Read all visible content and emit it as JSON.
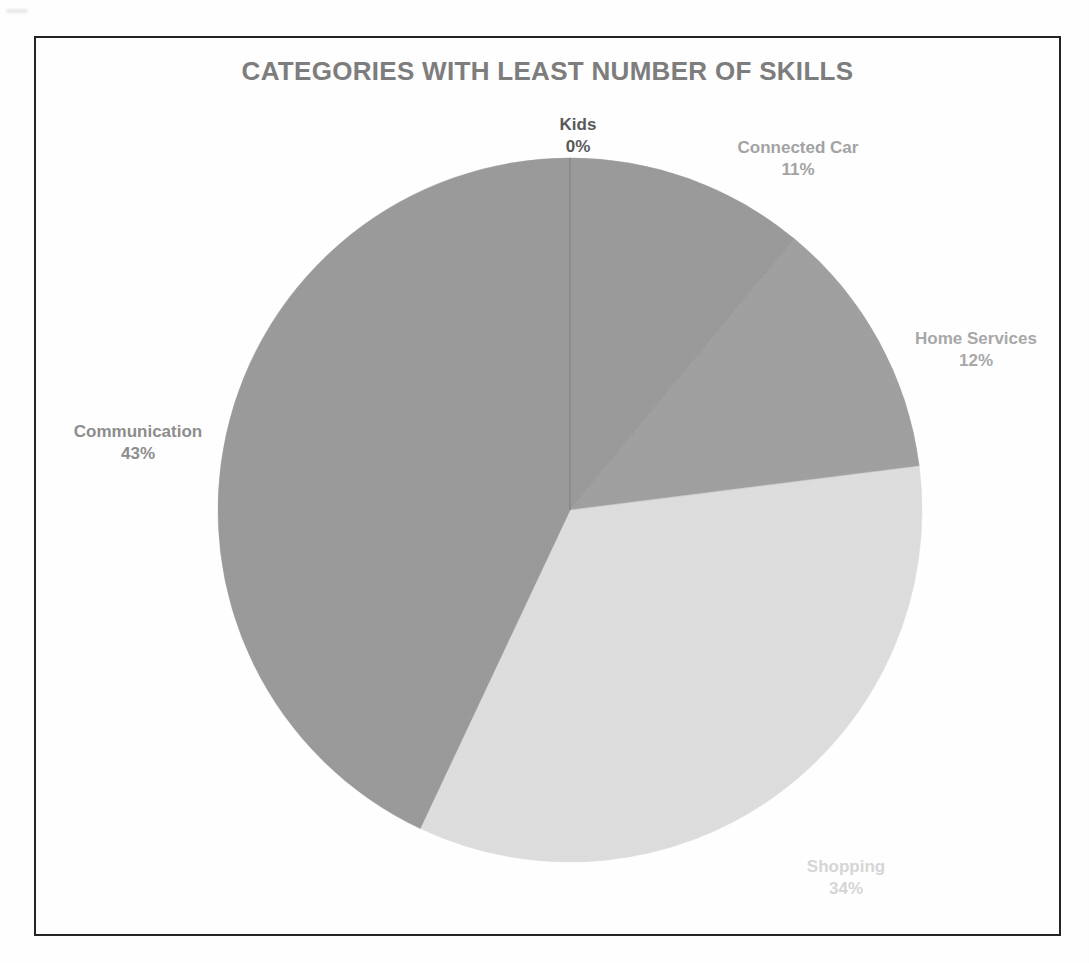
{
  "page": {
    "background_color": "#ffffff",
    "frame_border_color": "#232323"
  },
  "chart_data": {
    "type": "pie",
    "title": "CATEGORIES WITH LEAST NUMBER OF SKILLS",
    "xlabel": "",
    "ylabel": "",
    "legend_position": "none",
    "labels_position": "outside",
    "start_angle_deg": 0,
    "direction": "clockwise",
    "categories": [
      "Kids",
      "Connected Car",
      "Home Services",
      "Shopping",
      "Communication"
    ],
    "values": [
      0,
      11,
      12,
      34,
      43
    ],
    "value_labels": [
      "0%",
      "11%",
      "12%",
      "34%",
      "43%"
    ],
    "units": "percent",
    "total": 100,
    "slices": [
      {
        "name": "Kids",
        "value": 0,
        "value_label": "0%",
        "color": "#9d9d9d",
        "label_color": "#595959",
        "start_deg": 0,
        "end_deg": 0
      },
      {
        "name": "Connected Car",
        "value": 11,
        "value_label": "11%",
        "color": "#9a9a9a",
        "label_color": "#a3a3a3",
        "start_deg": 0,
        "end_deg": 39.6
      },
      {
        "name": "Home Services",
        "value": 12,
        "value_label": "12%",
        "color": "#a0a0a0",
        "label_color": "#a8a8a8",
        "start_deg": 39.6,
        "end_deg": 82.8
      },
      {
        "name": "Shopping",
        "value": 34,
        "value_label": "34%",
        "color": "#dddddd",
        "label_color": "#d6d6d6",
        "start_deg": 82.8,
        "end_deg": 205.2
      },
      {
        "name": "Communication",
        "value": 43,
        "value_label": "43%",
        "color": "#9a9a9a",
        "label_color": "#8d8d8d",
        "start_deg": 205.2,
        "end_deg": 360
      }
    ],
    "geometry": {
      "center_x": 534,
      "center_y": 472,
      "radius": 352
    }
  }
}
